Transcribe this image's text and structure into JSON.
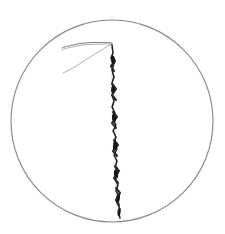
{
  "image": {
    "title": "Handwritten digit one in circle",
    "background_color": "#ffffff",
    "width": 225,
    "height": 234,
    "alt_text": "A roughly hand-drawn numeral 1 with a flag serif at the top, rendered with a jittery zigzag vertical stroke, enclosed inside a thin hand-drawn circle."
  },
  "circle": {
    "label": "enclosing-circle",
    "color": "#8a8a8f",
    "center_x": 112,
    "center_y": 121,
    "radius": 101,
    "stroke_width": 1.15
  },
  "glyph": {
    "label": "digit-one",
    "character": "1",
    "ink_color": "#1c1c1e",
    "faint_ink_color": "#9a9aa0",
    "apex_x": 112,
    "apex_y": 43,
    "tip_x": 120,
    "tip_y": 218,
    "flag_reach_x": 62,
    "flag_upper_end_y": 46,
    "flag_lower_end_y": 72
  },
  "strokes": {
    "flag_upper": "M 112 43 C 100 42, 84 42, 73 45 C 68 46, 64 47, 62 48",
    "flag_upper_shadow": "M 112 44 C 99 44, 83 44, 72 47 C 67 48, 64 49, 62 50",
    "flag_lower": "M 112 44 C 101 50, 88 58, 78 65 C 72 69, 67 71, 63 73",
    "stem_ghost": "M 112 44 L 113 60 L 112 78 L 114 96 L 113 112 L 115 130 L 114 148 L 117 166 L 116 184 L 119 202 L 120 218",
    "stem_main": "M 112 45 L 113 53 L 111 58 L 114 63 L 112 70 L 114 77 L 112 83 L 115 89 L 112 95 L 114 101 L 112 107 L 115 113 L 113 119 L 116 125 L 113 131 L 116 137 L 114 143 L 117 149 L 114 155 L 117 161 L 115 167 L 118 173 L 115 179 L 118 185 L 116 191 L 119 197 L 117 203 L 120 209 L 119 215 L 120 218",
    "jitter_1": "M 112 56 L 115 61 L 111 66 L 114 71",
    "jitter_2": "M 112 84 L 116 89 L 112 95 L 116 100",
    "jitter_3": "M 113 112 L 117 117 L 112 123 L 116 128",
    "jitter_4": "M 114 140 L 118 145 L 113 151 L 117 156",
    "jitter_5": "M 115 166 L 119 171 L 114 178 L 118 183",
    "jitter_6": "M 116 188 L 120 193 L 116 200 L 119 205"
  },
  "blobs": [
    {
      "cx": 113,
      "cy": 60,
      "rx": 2.0,
      "ry": 4.2,
      "rot": -6
    },
    {
      "cx": 113,
      "cy": 89,
      "rx": 1.9,
      "ry": 3.8,
      "rot": 8
    },
    {
      "cx": 114,
      "cy": 118,
      "rx": 2.0,
      "ry": 4.0,
      "rot": -8
    },
    {
      "cx": 115,
      "cy": 146,
      "rx": 2.0,
      "ry": 4.4,
      "rot": 9
    },
    {
      "cx": 116,
      "cy": 174,
      "rx": 2.0,
      "ry": 4.6,
      "rot": -7
    },
    {
      "cx": 118,
      "cy": 198,
      "rx": 1.9,
      "ry": 4.6,
      "rot": 8
    },
    {
      "cx": 119,
      "cy": 212,
      "rx": 1.5,
      "ry": 4.0,
      "rot": 4
    }
  ]
}
